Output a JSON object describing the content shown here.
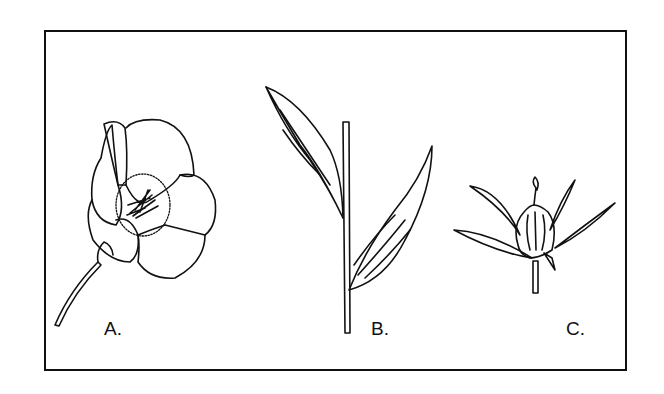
{
  "figure": {
    "panels": [
      {
        "id": "A",
        "label": "A.",
        "subject": "open flower with five petals, stamens and a stem"
      },
      {
        "id": "B",
        "label": "B.",
        "subject": "stem with two long lance-shaped leaves"
      },
      {
        "id": "C",
        "label": "C.",
        "subject": "fruit capsule surrounded by pointed sepals on a short stem"
      }
    ],
    "colors": {
      "line": "#111111",
      "background": "#ffffff"
    }
  }
}
